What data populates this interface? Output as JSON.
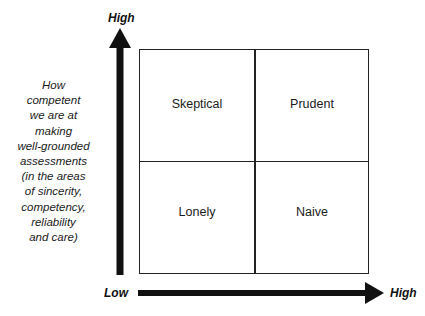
{
  "diagram": {
    "type": "2x2 matrix",
    "y_axis": {
      "high_label": "High",
      "caption_lines": [
        "How",
        "competent",
        "we are at",
        "making",
        "well-grounded",
        "assessments",
        "(in the areas",
        "of sincerity,",
        "competency,",
        "reliability",
        "and care)"
      ]
    },
    "x_axis": {
      "low_label": "Low",
      "high_label": "High"
    },
    "quadrants": {
      "top_left": "Skeptical",
      "top_right": "Prudent",
      "bottom_left": "Lonely",
      "bottom_right": "Naive"
    },
    "colors": {
      "arrow": "#111111",
      "grid_line": "#222222",
      "text": "#1a1a1a",
      "background": "#ffffff"
    }
  }
}
